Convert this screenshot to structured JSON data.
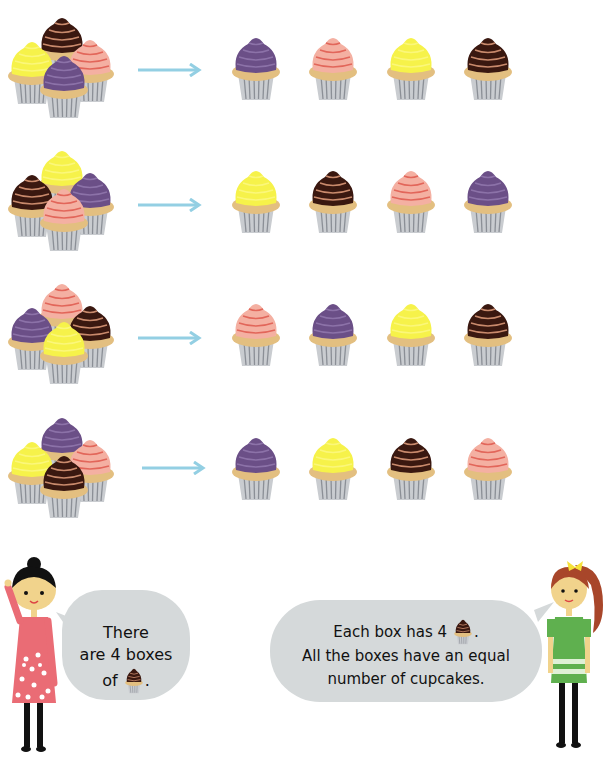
{
  "colors": {
    "purple": {
      "frost": "#6b4f87",
      "stripe": "#8c72a8"
    },
    "pink": {
      "frost": "#f4b0a2",
      "stripe": "#e2665a"
    },
    "yellow": {
      "frost": "#f6f24a",
      "stripe": "#fbf77a"
    },
    "chocolate": {
      "frost": "#3a1810",
      "stripe": "#c98a6c"
    },
    "cake": "#e3bf80",
    "liner": "#c9ccd0",
    "liner_stripe": "#8b8f96",
    "arrow": "#93cfe3",
    "bubble": "#d5d9da"
  },
  "rows": [
    {
      "group": [
        "chocolate",
        "yellow",
        "pink",
        "purple"
      ],
      "singles": [
        "purple",
        "pink",
        "yellow",
        "chocolate"
      ]
    },
    {
      "group": [
        "yellow",
        "chocolate",
        "purple",
        "pink"
      ],
      "singles": [
        "yellow",
        "chocolate",
        "pink",
        "purple"
      ]
    },
    {
      "group": [
        "pink",
        "purple",
        "chocolate",
        "yellow"
      ],
      "singles": [
        "pink",
        "purple",
        "yellow",
        "chocolate"
      ]
    },
    {
      "group": [
        "purple",
        "yellow",
        "pink",
        "chocolate"
      ],
      "singles": [
        "purple",
        "yellow",
        "chocolate",
        "pink"
      ]
    }
  ],
  "speech_left": {
    "line1": "There",
    "line2": "are 4 boxes",
    "line3_prefix": "of",
    "line3_suffix": "."
  },
  "speech_right": {
    "line1_prefix": "Each box has 4",
    "line1_suffix": ".",
    "line2": "All the boxes have an equal",
    "line3": "number of cupcakes."
  }
}
